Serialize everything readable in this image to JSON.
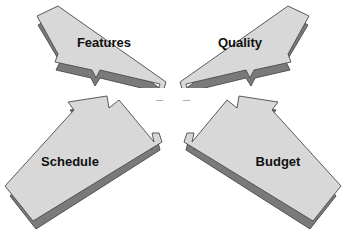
{
  "diagram": {
    "type": "converging-arrows",
    "background_color": "#ffffff",
    "arrow_face_color": "#d8d8d8",
    "arrow_shadow_color": "#7a7a7a",
    "arrow_outline_color": "#4a4a4a",
    "label_color": "#101010",
    "center_gap_color": "#ffffff",
    "arrows": [
      {
        "id": "features",
        "label": "Features",
        "direction": "down-right",
        "origin_corner": "top-left",
        "label_x": 104,
        "label_y": 47
      },
      {
        "id": "quality",
        "label": "Quality",
        "direction": "down-left",
        "origin_corner": "top-right",
        "label_x": 240,
        "label_y": 47
      },
      {
        "id": "schedule",
        "label": "Schedule",
        "direction": "up-right",
        "origin_corner": "bottom-left",
        "label_x": 70,
        "label_y": 166
      },
      {
        "id": "budget",
        "label": "Budget",
        "direction": "up-left",
        "origin_corner": "bottom-right",
        "label_x": 278,
        "label_y": 166
      }
    ]
  }
}
